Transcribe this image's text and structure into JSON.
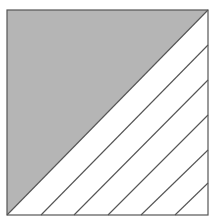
{
  "diagram": {
    "square": {
      "x": 7,
      "y": 10,
      "size": 201
    },
    "colors": {
      "shaded": "#b5b5b5",
      "unshaded": "#ffffff",
      "stroke": "#555555"
    },
    "shaded_region": "upper-left triangle",
    "strip_count": 6,
    "parallel_lines": [
      {
        "x1": 7,
        "y1": 215,
        "x2": 208,
        "y2": 10
      },
      {
        "x1": 41,
        "y1": 215,
        "x2": 208,
        "y2": 45
      },
      {
        "x1": 74,
        "y1": 215,
        "x2": 208,
        "y2": 80
      },
      {
        "x1": 108,
        "y1": 215,
        "x2": 208,
        "y2": 115
      },
      {
        "x1": 141,
        "y1": 215,
        "x2": 208,
        "y2": 150
      },
      {
        "x1": 175,
        "y1": 215,
        "x2": 208,
        "y2": 183
      }
    ]
  }
}
